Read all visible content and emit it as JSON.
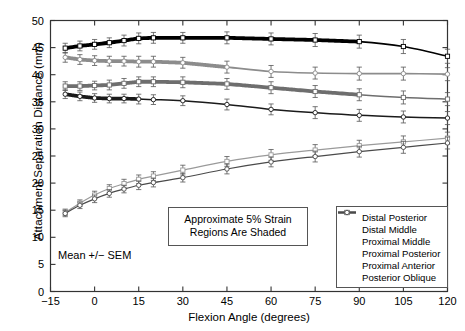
{
  "chart_data": {
    "type": "line",
    "title": "",
    "xlabel": "Flexion Angle (degrees)",
    "ylabel": "Attachment Separation Distance (mm)",
    "xlim": [
      -15,
      120
    ],
    "ylim": [
      0,
      50
    ],
    "xticks": [
      -15,
      0,
      15,
      30,
      45,
      60,
      75,
      90,
      105,
      120
    ],
    "yticks": [
      0,
      5,
      10,
      15,
      20,
      25,
      30,
      35,
      40,
      45,
      50
    ],
    "grid": false,
    "legend_position": "lower-right",
    "error_bars": "SEM",
    "annotations": [
      {
        "name": "strain-note",
        "line1": "Approximate 5% Strain",
        "line2": "Regions Are Shaded"
      },
      {
        "name": "mean-note",
        "text": "Mean +/− SEM"
      }
    ],
    "x": [
      -10,
      -5,
      0,
      5,
      10,
      15,
      20,
      30,
      45,
      60,
      75,
      90,
      105,
      120
    ],
    "series": [
      {
        "name": "Distal Posterior",
        "color": "#000000",
        "marker": "square",
        "width": 1.6,
        "values": [
          44.9,
          45.3,
          45.6,
          45.9,
          46.3,
          46.7,
          46.8,
          46.8,
          46.8,
          46.6,
          46.4,
          46.1,
          45.2,
          43.4
        ],
        "errors": [
          0.9,
          0.9,
          0.9,
          0.9,
          1.0,
          1.0,
          1.0,
          1.0,
          1.1,
          1.1,
          1.2,
          1.2,
          1.3,
          1.3
        ],
        "shaded_from": -10,
        "shaded_to": 90
      },
      {
        "name": "Distal Middle",
        "color": "#8c8c8c",
        "marker": "circle",
        "width": 1.6,
        "values": [
          43.2,
          42.8,
          42.6,
          42.5,
          42.5,
          42.4,
          42.4,
          42.2,
          41.4,
          40.6,
          40.3,
          40.2,
          40.2,
          40.1
        ],
        "errors": [
          0.9,
          0.9,
          0.9,
          0.9,
          0.9,
          1.0,
          1.0,
          1.0,
          1.1,
          1.1,
          1.1,
          1.2,
          1.2,
          1.2
        ],
        "shaded_from": -10,
        "shaded_to": 45
      },
      {
        "name": "Proximal Middle",
        "color": "#6e6e6e",
        "marker": "square",
        "width": 1.6,
        "values": [
          37.9,
          37.9,
          38.0,
          38.1,
          38.4,
          38.7,
          38.7,
          38.6,
          38.3,
          37.6,
          36.9,
          36.3,
          35.8,
          35.5
        ],
        "errors": [
          0.8,
          0.8,
          0.8,
          0.9,
          0.9,
          0.9,
          0.9,
          1.0,
          1.0,
          1.1,
          1.1,
          1.1,
          1.2,
          1.2
        ],
        "shaded_from": -10,
        "shaded_to": 90
      },
      {
        "name": "Proximal Posterior",
        "color": "#1a1a1a",
        "marker": "circle",
        "width": 1.5,
        "values": [
          36.4,
          36.0,
          35.7,
          35.6,
          35.6,
          35.5,
          35.4,
          35.2,
          34.5,
          33.6,
          33.0,
          32.5,
          32.2,
          32.0
        ],
        "errors": [
          0.8,
          0.8,
          0.8,
          0.8,
          0.8,
          0.9,
          0.9,
          0.9,
          1.0,
          1.0,
          1.1,
          1.1,
          1.1,
          1.2
        ],
        "shaded_from": -10,
        "shaded_to": 15
      },
      {
        "name": "Proximal Anterior",
        "color": "#9a9a9a",
        "marker": "square",
        "width": 1.2,
        "values": [
          14.6,
          16.3,
          17.8,
          19.0,
          19.9,
          20.7,
          21.3,
          22.4,
          24.0,
          25.2,
          26.1,
          26.9,
          27.6,
          28.3
        ],
        "errors": [
          0.6,
          0.6,
          0.7,
          0.7,
          0.8,
          0.8,
          0.8,
          0.9,
          0.9,
          1.0,
          1.0,
          1.0,
          1.1,
          1.1
        ],
        "shaded_from": null,
        "shaded_to": null
      },
      {
        "name": "Posterior Oblique",
        "color": "#4a4a4a",
        "marker": "circle",
        "width": 1.2,
        "values": [
          14.4,
          15.9,
          17.1,
          18.1,
          18.9,
          19.6,
          20.1,
          21.0,
          22.6,
          23.9,
          24.9,
          25.8,
          26.6,
          27.4
        ],
        "errors": [
          0.6,
          0.6,
          0.7,
          0.7,
          0.7,
          0.8,
          0.8,
          0.8,
          0.9,
          0.9,
          1.0,
          1.0,
          1.1,
          1.1
        ],
        "shaded_from": null,
        "shaded_to": null
      }
    ]
  }
}
